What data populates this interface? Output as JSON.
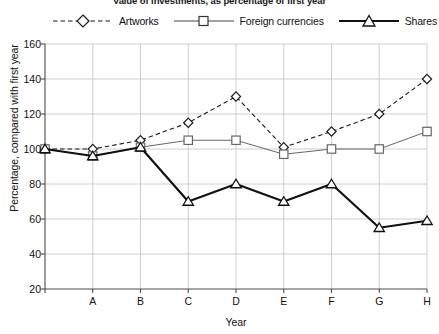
{
  "chart_data": {
    "type": "line",
    "title": "Value of investments, as percentage of first year",
    "xlabel": "Year",
    "ylabel": "Percentage, compared with first year",
    "categories": [
      "",
      "A",
      "B",
      "C",
      "D",
      "E",
      "F",
      "G",
      "H"
    ],
    "ylim": [
      20,
      160
    ],
    "yticks": [
      20,
      40,
      60,
      80,
      100,
      120,
      140,
      160
    ],
    "ytick_labels": [
      "20",
      "40",
      "60",
      "80",
      "100",
      "120",
      "140",
      "160"
    ],
    "grid": true,
    "legend_position": "top",
    "series": [
      {
        "name": "Artworks",
        "marker": "diamond",
        "line_style": "dashed",
        "color": "#1a1a1a",
        "line_width": 1.1,
        "values": [
          100,
          100,
          105,
          115,
          130,
          101,
          110,
          120,
          140
        ]
      },
      {
        "name": "Foreign currencies",
        "marker": "square",
        "line_style": "solid",
        "color": "#666666",
        "line_width": 1.0,
        "values": [
          100,
          96,
          101,
          105,
          105,
          97,
          100,
          100,
          110
        ]
      },
      {
        "name": "Shares",
        "marker": "triangle",
        "line_style": "solid",
        "color": "#111111",
        "line_width": 2.2,
        "values": [
          100,
          96,
          101,
          70,
          80,
          70,
          80,
          55,
          59
        ]
      }
    ]
  },
  "legend": {
    "items": [
      {
        "label": "Artworks",
        "icon": "diamond-marker-dashed-line-icon"
      },
      {
        "label": "Foreign currencies",
        "icon": "square-marker-solid-line-icon"
      },
      {
        "label": "Shares",
        "icon": "triangle-marker-thick-line-icon"
      }
    ]
  },
  "axes": {
    "x_title": "Year",
    "y_title": "Percentage, compared with first year"
  },
  "colors": {
    "background": "#ffffff",
    "grid": "#c8c8c8",
    "axis": "#4d4d4d",
    "text": "#111111",
    "artworks": "#1a1a1a",
    "foreign_currencies": "#666666",
    "shares": "#111111"
  }
}
